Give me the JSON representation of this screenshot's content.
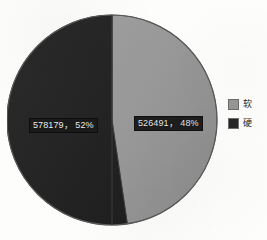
{
  "chart_data": {
    "type": "pie",
    "title": "",
    "labels": [
      "硬",
      "软"
    ],
    "values": [
      578179,
      526491
    ],
    "percents": [
      52,
      48
    ],
    "data_labels": [
      "578179， 52%",
      "526491， 48%"
    ],
    "colors": [
      "#262626",
      "#969696"
    ],
    "legend": {
      "position": "right",
      "entries": [
        {
          "label": "软",
          "color": "#969696",
          "value": 526491,
          "percent": 48
        },
        {
          "label": "硬",
          "color": "#262626",
          "value": 578179,
          "percent": 52
        }
      ]
    },
    "slices": [
      {
        "name": "硬",
        "data_label": "578179， 52%",
        "value": 578179,
        "percent": 52,
        "color": "#262626"
      },
      {
        "name": "软",
        "data_label": "526491， 48%",
        "value": 526491,
        "percent": 48,
        "color": "#969696"
      }
    ],
    "grid": false,
    "start_angle_deg": 0
  },
  "colors": {
    "background": "#fdfdfc",
    "slice_hard": "#262626",
    "slice_soft": "#969696",
    "outline": "#4a4a4a",
    "label_box": "#1b1b1b",
    "label_text": "#efefef"
  }
}
